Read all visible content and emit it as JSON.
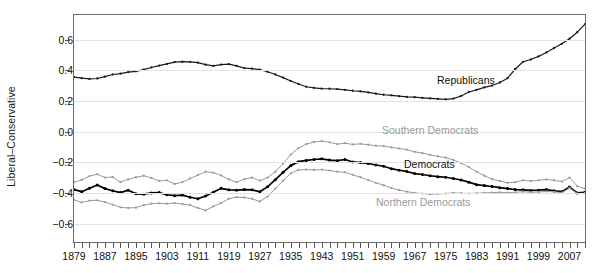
{
  "chart_data": {
    "type": "line",
    "title": "",
    "subtitle": "",
    "xlabel": "",
    "ylabel": "Liberal–Conservative",
    "xlim": [
      1879,
      2011
    ],
    "ylim": [
      -0.72,
      0.76
    ],
    "grid": true,
    "grid_axis": "y",
    "legend_position": "inline-annotations",
    "y_ticks": [
      0.6,
      0.4,
      0.2,
      0.0,
      -0.2,
      -0.4,
      -0.6
    ],
    "y_tick_labels": [
      "0.6",
      "0.4",
      "0.2",
      "0.0",
      "-0.2",
      "-0.4",
      "-0.6"
    ],
    "x_ticks": [
      1879,
      1887,
      1895,
      1903,
      1911,
      1919,
      1927,
      1935,
      1943,
      1951,
      1959,
      1967,
      1975,
      1983,
      1991,
      1999,
      2007
    ],
    "x_tick_labels": [
      "1879",
      "1887",
      "1895",
      "1903",
      "1911",
      "1919",
      "1927",
      "1935",
      "1943",
      "1951",
      "1959",
      "1967",
      "1975",
      "1983",
      "1991",
      "1999",
      "2007"
    ],
    "x_minor_tick_step": 2,
    "x": [
      1879,
      1881,
      1883,
      1885,
      1887,
      1889,
      1891,
      1893,
      1895,
      1897,
      1899,
      1901,
      1903,
      1905,
      1907,
      1909,
      1911,
      1913,
      1915,
      1917,
      1919,
      1921,
      1923,
      1925,
      1927,
      1929,
      1931,
      1933,
      1935,
      1937,
      1939,
      1941,
      1943,
      1945,
      1947,
      1949,
      1951,
      1953,
      1955,
      1957,
      1959,
      1961,
      1963,
      1965,
      1967,
      1969,
      1971,
      1973,
      1975,
      1977,
      1979,
      1981,
      1983,
      1985,
      1987,
      1989,
      1991,
      1993,
      1995,
      1997,
      1999,
      2001,
      2003,
      2005,
      2007,
      2009,
      2011
    ],
    "series": [
      {
        "name": "Republicans",
        "color": "#1a1a1a",
        "marker": "dot",
        "label_position": {
          "x": 437,
          "y": 74
        },
        "values": [
          0.355,
          0.348,
          0.343,
          0.346,
          0.358,
          0.372,
          0.378,
          0.388,
          0.393,
          0.404,
          0.418,
          0.43,
          0.441,
          0.453,
          0.456,
          0.455,
          0.449,
          0.436,
          0.428,
          0.437,
          0.44,
          0.428,
          0.414,
          0.41,
          0.404,
          0.39,
          0.372,
          0.352,
          0.33,
          0.31,
          0.292,
          0.285,
          0.28,
          0.279,
          0.277,
          0.272,
          0.266,
          0.262,
          0.255,
          0.247,
          0.24,
          0.236,
          0.231,
          0.226,
          0.224,
          0.22,
          0.216,
          0.213,
          0.21,
          0.215,
          0.232,
          0.258,
          0.272,
          0.288,
          0.3,
          0.32,
          0.348,
          0.408,
          0.455,
          0.47,
          0.49,
          0.516,
          0.545,
          0.572,
          0.605,
          0.648,
          0.7
        ]
      },
      {
        "name": "Southern Democrats",
        "color": "#9a9a9a",
        "marker": "dot",
        "label_position": {
          "x": 382,
          "y": 124
        },
        "values": [
          -0.33,
          -0.315,
          -0.29,
          -0.278,
          -0.3,
          -0.296,
          -0.33,
          -0.312,
          -0.298,
          -0.288,
          -0.302,
          -0.322,
          -0.318,
          -0.342,
          -0.33,
          -0.306,
          -0.284,
          -0.262,
          -0.268,
          -0.286,
          -0.312,
          -0.33,
          -0.31,
          -0.3,
          -0.32,
          -0.3,
          -0.262,
          -0.21,
          -0.15,
          -0.108,
          -0.082,
          -0.068,
          -0.062,
          -0.07,
          -0.082,
          -0.076,
          -0.084,
          -0.08,
          -0.086,
          -0.092,
          -0.095,
          -0.103,
          -0.11,
          -0.118,
          -0.132,
          -0.14,
          -0.152,
          -0.162,
          -0.17,
          -0.185,
          -0.205,
          -0.232,
          -0.262,
          -0.288,
          -0.31,
          -0.322,
          -0.334,
          -0.33,
          -0.318,
          -0.322,
          -0.318,
          -0.312,
          -0.318,
          -0.326,
          -0.3,
          -0.356,
          -0.372
        ]
      },
      {
        "name": "Democrats",
        "color": "#000000",
        "marker": "dot",
        "label_position": {
          "x": 404,
          "y": 158
        },
        "values": [
          -0.378,
          -0.392,
          -0.37,
          -0.348,
          -0.372,
          -0.386,
          -0.398,
          -0.382,
          -0.406,
          -0.408,
          -0.4,
          -0.398,
          -0.412,
          -0.418,
          -0.414,
          -0.428,
          -0.438,
          -0.42,
          -0.396,
          -0.37,
          -0.38,
          -0.382,
          -0.378,
          -0.38,
          -0.392,
          -0.36,
          -0.314,
          -0.266,
          -0.222,
          -0.196,
          -0.188,
          -0.182,
          -0.178,
          -0.186,
          -0.19,
          -0.182,
          -0.198,
          -0.202,
          -0.208,
          -0.218,
          -0.226,
          -0.242,
          -0.252,
          -0.26,
          -0.274,
          -0.28,
          -0.288,
          -0.294,
          -0.298,
          -0.306,
          -0.316,
          -0.33,
          -0.346,
          -0.352,
          -0.358,
          -0.366,
          -0.372,
          -0.378,
          -0.38,
          -0.384,
          -0.382,
          -0.378,
          -0.386,
          -0.392,
          -0.362,
          -0.4,
          -0.396
        ]
      },
      {
        "name": "Northern Democrats",
        "color": "#9a9a9a",
        "marker": "dot",
        "label_position": {
          "x": 376,
          "y": 196
        },
        "values": [
          -0.445,
          -0.462,
          -0.45,
          -0.448,
          -0.46,
          -0.476,
          -0.494,
          -0.498,
          -0.496,
          -0.48,
          -0.47,
          -0.468,
          -0.47,
          -0.466,
          -0.472,
          -0.48,
          -0.498,
          -0.514,
          -0.488,
          -0.466,
          -0.438,
          -0.428,
          -0.43,
          -0.438,
          -0.456,
          -0.424,
          -0.372,
          -0.32,
          -0.272,
          -0.25,
          -0.248,
          -0.25,
          -0.248,
          -0.254,
          -0.262,
          -0.266,
          -0.282,
          -0.298,
          -0.316,
          -0.334,
          -0.35,
          -0.368,
          -0.382,
          -0.392,
          -0.4,
          -0.404,
          -0.408,
          -0.406,
          -0.404,
          -0.4,
          -0.402,
          -0.404,
          -0.402,
          -0.4,
          -0.398,
          -0.396,
          -0.398,
          -0.396,
          -0.392,
          -0.396,
          -0.394,
          -0.39,
          -0.394,
          -0.398,
          -0.368,
          -0.404,
          -0.402
        ]
      }
    ]
  },
  "colors": {
    "axis": "#6b6b6b",
    "grid": "#e2e2e2",
    "text": "#111111",
    "series_dark": "#1a1a1a",
    "series_grey": "#9a9a9a",
    "background": "#ffffff"
  }
}
